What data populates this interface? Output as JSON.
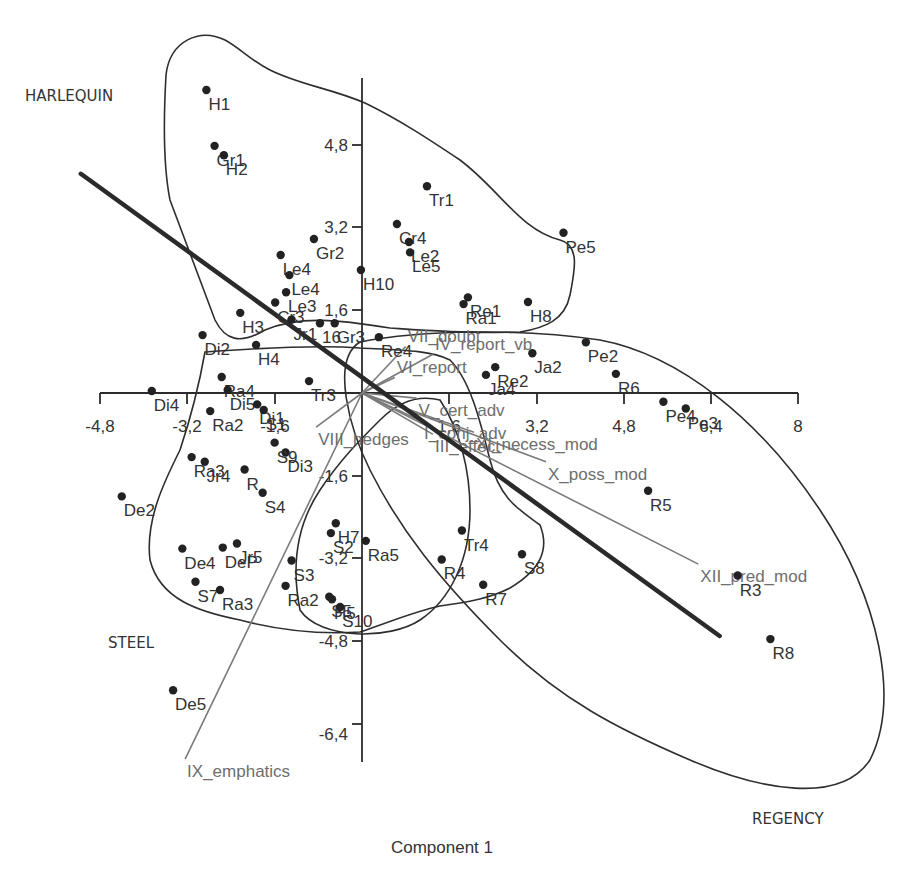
{
  "chart_data": {
    "type": "scatter",
    "title": "",
    "xlabel": "Component 1",
    "ylabel": "",
    "xlim": [
      -4.8,
      8
    ],
    "ylim": [
      -6.4,
      4.8
    ],
    "grid": false,
    "x_ticks": [
      "-4,8",
      "-3,2",
      "-1,6",
      "",
      "1,6",
      "3,2",
      "4,8",
      "6,4",
      "8"
    ],
    "y_ticks": [
      "4,8",
      "3,2",
      "1,6",
      "",
      "-1,6",
      "-3,2",
      "-4,8",
      "-6,4"
    ],
    "group_labels": [
      {
        "name": "HARLEQUIN",
        "px": 25,
        "py": 101
      },
      {
        "name": "STEEL",
        "px": 108,
        "py": 648
      },
      {
        "name": "REGENCY",
        "px": 752,
        "py": 824
      }
    ],
    "points": [
      {
        "label": "H1",
        "x": -2.85,
        "y": 5.86
      },
      {
        "label": "Gr1",
        "x": -2.7,
        "y": 4.78
      },
      {
        "label": "H2",
        "x": -2.53,
        "y": 4.6
      },
      {
        "label": "Tr1",
        "x": 1.19,
        "y": 4.0
      },
      {
        "label": "Pe5",
        "x": 3.69,
        "y": 3.1
      },
      {
        "label": "Cr4",
        "x": 0.64,
        "y": 3.27
      },
      {
        "label": "Le2",
        "x": 0.86,
        "y": 2.92
      },
      {
        "label": "Le5",
        "x": 0.88,
        "y": 2.72
      },
      {
        "label": "Gr2",
        "x": -0.88,
        "y": 2.98
      },
      {
        "label": "H10",
        "x": -0.02,
        "y": 2.38
      },
      {
        "label": "Le4",
        "x": -1.49,
        "y": 2.67
      },
      {
        "label": "Le4b",
        "x": -1.33,
        "y": 2.28
      },
      {
        "label": "Le3",
        "x": -1.39,
        "y": 1.95
      },
      {
        "label": "Cr3",
        "x": -1.59,
        "y": 1.75
      },
      {
        "label": "Jr1",
        "x": -1.29,
        "y": 1.42
      },
      {
        "label": "16",
        "x": -0.77,
        "y": 1.35
      },
      {
        "label": "H3",
        "x": -2.23,
        "y": 1.55
      },
      {
        "label": "H8",
        "x": 3.04,
        "y": 1.76
      },
      {
        "label": "Ra1",
        "x": 1.86,
        "y": 1.72
      },
      {
        "label": "Re1",
        "x": 1.94,
        "y": 1.85
      },
      {
        "label": "Re4",
        "x": 0.31,
        "y": 1.08
      },
      {
        "label": "Gr3",
        "x": -0.5,
        "y": 1.35
      },
      {
        "label": "Di2",
        "x": -2.92,
        "y": 1.12
      },
      {
        "label": "H4",
        "x": -1.94,
        "y": 0.93
      },
      {
        "label": "Ra4",
        "x": -2.57,
        "y": 0.31
      },
      {
        "label": "Ja2",
        "x": 3.12,
        "y": 0.77
      },
      {
        "label": "Pe2",
        "x": 4.1,
        "y": 0.98
      },
      {
        "label": "R6",
        "x": 4.65,
        "y": 0.37
      },
      {
        "label": "Ja4",
        "x": 2.27,
        "y": 0.35
      },
      {
        "label": "Re2",
        "x": 2.44,
        "y": 0.5
      },
      {
        "label": "Tr3",
        "x": -0.97,
        "y": 0.23
      },
      {
        "label": "Di4",
        "x": -3.85,
        "y": 0.04
      },
      {
        "label": "Di5",
        "x": -2.46,
        "y": 0.06
      },
      {
        "label": "Ra2",
        "x": -2.78,
        "y": -0.35
      },
      {
        "label": "Di1",
        "x": -1.92,
        "y": -0.22
      },
      {
        "label": "S1",
        "x": -1.8,
        "y": -0.33
      },
      {
        "label": "Di3",
        "x": -1.4,
        "y": -1.15
      },
      {
        "label": "S9",
        "x": -1.6,
        "y": -0.96
      },
      {
        "label": "Pe4",
        "x": 5.52,
        "y": -0.17
      },
      {
        "label": "Pe3",
        "x": 5.93,
        "y": -0.3
      },
      {
        "label": "R5",
        "x": 5.24,
        "y": -1.89
      },
      {
        "label": "Ra3b",
        "x": -3.12,
        "y": -1.24
      },
      {
        "label": "Jr4",
        "x": -2.88,
        "y": -1.33
      },
      {
        "label": "R",
        "x": -2.15,
        "y": -1.48
      },
      {
        "label": "S4",
        "x": -1.82,
        "y": -1.93
      },
      {
        "label": "De2",
        "x": -4.4,
        "y": -2.0
      },
      {
        "label": "H7",
        "x": -0.48,
        "y": -2.52
      },
      {
        "label": "S2",
        "x": -0.57,
        "y": -2.71
      },
      {
        "label": "Ra5",
        "x": 0.07,
        "y": -2.86
      },
      {
        "label": "Tr4",
        "x": 1.83,
        "y": -2.66
      },
      {
        "label": "R4",
        "x": 1.46,
        "y": -3.22
      },
      {
        "label": "S8",
        "x": 2.93,
        "y": -3.12
      },
      {
        "label": "R7",
        "x": 2.22,
        "y": -3.71
      },
      {
        "label": "De4",
        "x": -3.29,
        "y": -3.01
      },
      {
        "label": "Jr5",
        "x": -2.29,
        "y": -2.91
      },
      {
        "label": "DeP",
        "x": -2.55,
        "y": -2.99
      },
      {
        "label": "S3",
        "x": -1.29,
        "y": -3.24
      },
      {
        "label": "S7",
        "x": -3.05,
        "y": -3.65
      },
      {
        "label": "Ra3",
        "x": -2.6,
        "y": -3.81
      },
      {
        "label": "Ra2b",
        "x": -1.4,
        "y": -3.73
      },
      {
        "label": "S5",
        "x": -0.6,
        "y": -3.94
      },
      {
        "label": "H5",
        "x": -0.55,
        "y": -3.99
      },
      {
        "label": "S10",
        "x": -0.4,
        "y": -4.14
      },
      {
        "label": "R3",
        "x": 6.88,
        "y": -3.53
      },
      {
        "label": "R8",
        "x": 7.48,
        "y": -4.76
      },
      {
        "label": "De5",
        "x": -3.46,
        "y": -5.75
      }
    ],
    "loading_vectors": [
      {
        "label": "IX_emphatics",
        "x": -3.24,
        "y": -7.08
      },
      {
        "label": "XII_pred_mod",
        "x": 6.16,
        "y": -3.31
      },
      {
        "label": "X_poss_mod",
        "x": 3.37,
        "y": -1.33
      },
      {
        "label": "XI_necess_mod",
        "x": 2.05,
        "y": -0.76
      },
      {
        "label": "VIII_hedges",
        "x": -0.84,
        "y": -0.66
      },
      {
        "label": "III_effect",
        "x": 1.3,
        "y": -0.8
      },
      {
        "label": "I_conj_adv",
        "x": 1.1,
        "y": -0.55
      },
      {
        "label": "V_cert_adv",
        "x": 1.0,
        "y": -0.1
      },
      {
        "label": "IV_report_vb",
        "x": 1.3,
        "y": 0.75
      },
      {
        "label": "VI_report",
        "x": 0.6,
        "y": 0.3
      },
      {
        "label": "VII_doubt",
        "x": 0.8,
        "y": 0.9
      }
    ],
    "trend_line": {
      "from": [
        -5.15,
        4.24
      ],
      "to": [
        6.55,
        -4.7
      ]
    },
    "hulls": [
      "HARLEQUIN",
      "STEEL",
      "REGENCY"
    ]
  },
  "labels": {
    "x_axis_title": "Component 1",
    "harlequin": "HARLEQUIN",
    "steel": "STEEL",
    "regency": "REGENCY"
  },
  "colors": {
    "points": "#222222",
    "text": "#333333",
    "vectors": "#7a7a7a",
    "trend": "#2a2a2a",
    "hulls": "#2e2e2e"
  }
}
